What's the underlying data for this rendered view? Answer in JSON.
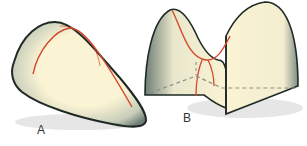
{
  "figure": {
    "panels": [
      {
        "id": "A",
        "label": "A",
        "shape": "elliptic surface (dome-like, positive curvature)"
      },
      {
        "id": "B",
        "label": "B",
        "shape": "saddle surface (hyperbolic, negative curvature)"
      }
    ],
    "colors": {
      "surface_fill": "#faf3d4",
      "surface_shade": "#8f9c92",
      "outline": "#1f2a26",
      "curve": "#d2492c",
      "dashed": "#8a8f86",
      "shadow": "#e4e4e4"
    }
  }
}
